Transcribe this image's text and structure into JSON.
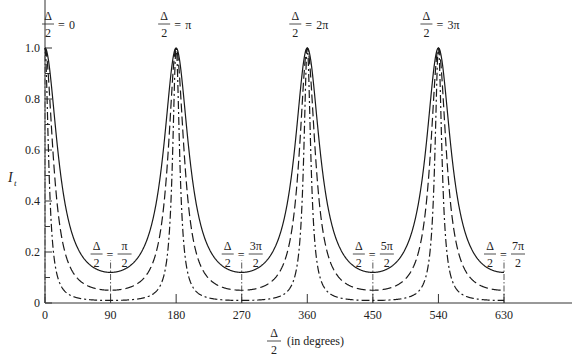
{
  "chart_data": {
    "type": "line",
    "title": "",
    "xlabel": "Δ/2 (in degrees)",
    "xlabel_parts": {
      "numerator": "Δ",
      "denominator": "2",
      "suffix": "(in degrees)"
    },
    "ylabel": "I_t",
    "ylabel_parts": {
      "main": "I",
      "sub": "t"
    },
    "xlim": [
      0,
      630
    ],
    "ylim": [
      0,
      1.0
    ],
    "x_ticks": [
      0,
      90,
      180,
      270,
      360,
      450,
      540,
      630
    ],
    "x_tick_labels": [
      "0",
      "90",
      "180",
      "270",
      "360",
      "450",
      "540",
      "630"
    ],
    "y_ticks_major": [
      0,
      0.2,
      0.4,
      0.6,
      0.8,
      1.0
    ],
    "y_tick_labels": [
      "0",
      "0.2",
      "0.4",
      "0.6",
      "0.8",
      "1.0"
    ],
    "y_ticks_minor": [
      0.1,
      0.3,
      0.5,
      0.7,
      0.9
    ],
    "grid": false,
    "legend": null,
    "series": [
      {
        "name": "low finesse",
        "style": "solid",
        "peak": 1.0,
        "minimum": 0.12,
        "peaks_at": [
          0,
          180,
          360,
          540
        ]
      },
      {
        "name": "medium finesse",
        "style": "dashed",
        "peak": 1.0,
        "minimum": 0.05,
        "peaks_at": [
          0,
          180,
          360,
          540
        ]
      },
      {
        "name": "high finesse",
        "style": "dash-dot",
        "peak": 1.0,
        "minimum": 0.01,
        "peaks_at": [
          0,
          180,
          360,
          540
        ]
      }
    ],
    "sample_points": {
      "x": [
        0,
        30,
        60,
        90,
        120,
        150,
        180,
        210,
        240,
        270,
        300,
        330,
        360,
        390,
        420,
        450,
        480,
        510,
        540,
        570,
        600,
        630
      ],
      "solid": [
        1.0,
        0.35,
        0.15,
        0.12,
        0.15,
        0.35,
        1.0,
        0.35,
        0.15,
        0.12,
        0.15,
        0.35,
        1.0,
        0.35,
        0.15,
        0.12,
        0.15,
        0.35,
        1.0,
        0.35,
        0.15,
        0.12
      ],
      "dashed": [
        1.0,
        0.17,
        0.07,
        0.05,
        0.07,
        0.17,
        1.0,
        0.17,
        0.07,
        0.05,
        0.07,
        0.17,
        1.0,
        0.17,
        0.07,
        0.05,
        0.07,
        0.17,
        1.0,
        0.17,
        0.07,
        0.05
      ],
      "dash_dot": [
        1.0,
        0.04,
        0.013,
        0.01,
        0.013,
        0.04,
        1.0,
        0.04,
        0.013,
        0.01,
        0.013,
        0.04,
        1.0,
        0.04,
        0.013,
        0.01,
        0.013,
        0.04,
        1.0,
        0.04,
        0.013,
        0.01
      ]
    },
    "annotations": [
      {
        "x": 0,
        "position": "peak",
        "lhs_num": "Δ",
        "lhs_den": "2",
        "rhs": "0"
      },
      {
        "x": 180,
        "position": "peak",
        "lhs_num": "Δ",
        "lhs_den": "2",
        "rhs": "π"
      },
      {
        "x": 360,
        "position": "peak",
        "lhs_num": "Δ",
        "lhs_den": "2",
        "rhs": "2π"
      },
      {
        "x": 540,
        "position": "peak",
        "lhs_num": "Δ",
        "lhs_den": "2",
        "rhs": "3π"
      },
      {
        "x": 90,
        "position": "trough",
        "lhs_num": "Δ",
        "lhs_den": "2",
        "rhs_num": "π",
        "rhs_den": "2"
      },
      {
        "x": 270,
        "position": "trough",
        "lhs_num": "Δ",
        "lhs_den": "2",
        "rhs_num": "3π",
        "rhs_den": "2"
      },
      {
        "x": 450,
        "position": "trough",
        "lhs_num": "Δ",
        "lhs_den": "2",
        "rhs_num": "5π",
        "rhs_den": "2"
      },
      {
        "x": 630,
        "position": "trough",
        "lhs_num": "Δ",
        "lhs_den": "2",
        "rhs_num": "7π",
        "rhs_den": "2"
      }
    ],
    "colors": {
      "line": "#1a1a1a",
      "axis": "#333333",
      "background": "#ffffff"
    }
  }
}
